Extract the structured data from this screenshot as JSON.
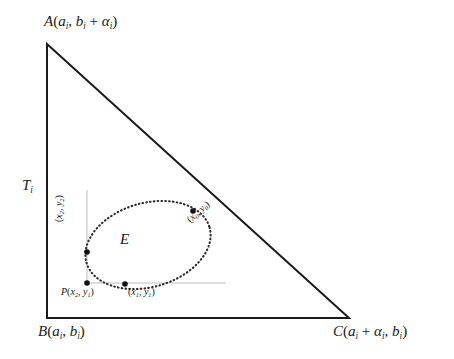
{
  "figure": {
    "type": "geometry-diagram",
    "stroke_color": "#1a1a1a",
    "guide_color": "#b9b9b9",
    "background": "#ffffff"
  },
  "triangle": {
    "name": "T_i",
    "label": "T",
    "label_sub": "i",
    "vertices": {
      "A": {
        "name": "A",
        "coords_open": "(",
        "x_var": "a",
        "x_sub": "i",
        "sep": ", ",
        "y_expr_1": "b",
        "y_sub_1": "i",
        "plus": " + ",
        "y_expr_2": "α",
        "y_sub_2": "i",
        "coords_close": ")",
        "full": "A(a_i, b_i + α_i)",
        "px": 47,
        "py": 44
      },
      "B": {
        "name": "B",
        "x_var": "a",
        "x_sub": "i",
        "y_var": "b",
        "y_sub": "i",
        "full": "B(a_i, b_i)",
        "px": 47,
        "py": 318
      },
      "C": {
        "name": "C",
        "x_var_1": "a",
        "x_sub_1": "i",
        "x_var_2": "α",
        "x_sub_2": "i",
        "y_var": "b",
        "y_sub": "i",
        "full": "C(a_i + α_i, b_i)",
        "px": 349,
        "py": 318
      }
    }
  },
  "ellipse": {
    "label": "E",
    "style": "dotted",
    "center_px": [
      148,
      245
    ],
    "rx": 64,
    "ry": 42,
    "rotation_deg": -16
  },
  "points": [
    {
      "id": "p0",
      "label_prefix": "",
      "label": "(x₀, y₀)",
      "x_var": "x",
      "x_sub": "0",
      "y_var": "y",
      "y_sub": "0",
      "px": 193,
      "py": 211,
      "rotation_deg": -42
    },
    {
      "id": "p2",
      "label_prefix": "",
      "label": "(x₂, y₂)",
      "x_var": "x",
      "x_sub": "2",
      "y_var": "y",
      "y_sub": "2",
      "px": 87,
      "py": 252,
      "rotation_deg": -90
    },
    {
      "id": "pP",
      "label_prefix": "P",
      "label": "P(x₂, y₁)",
      "x_var": "x",
      "x_sub": "2",
      "y_var": "y",
      "y_sub": "1",
      "px": 87,
      "py": 283,
      "rotation_deg": 0
    },
    {
      "id": "p1",
      "label_prefix": "",
      "label": "(x₁, y₁)",
      "x_var": "x",
      "x_sub": "1",
      "y_var": "y",
      "y_sub": "1",
      "px": 125,
      "py": 284,
      "rotation_deg": 0
    }
  ],
  "guides": {
    "vertical": {
      "x": 87,
      "y1": 190,
      "y2": 286
    },
    "horizontal": {
      "y": 283,
      "x1": 87,
      "x2": 226
    }
  },
  "symbols": {
    "alpha": "α",
    "plus": "+",
    "comma": ",",
    "paren_open": "(",
    "paren_close": ")"
  }
}
